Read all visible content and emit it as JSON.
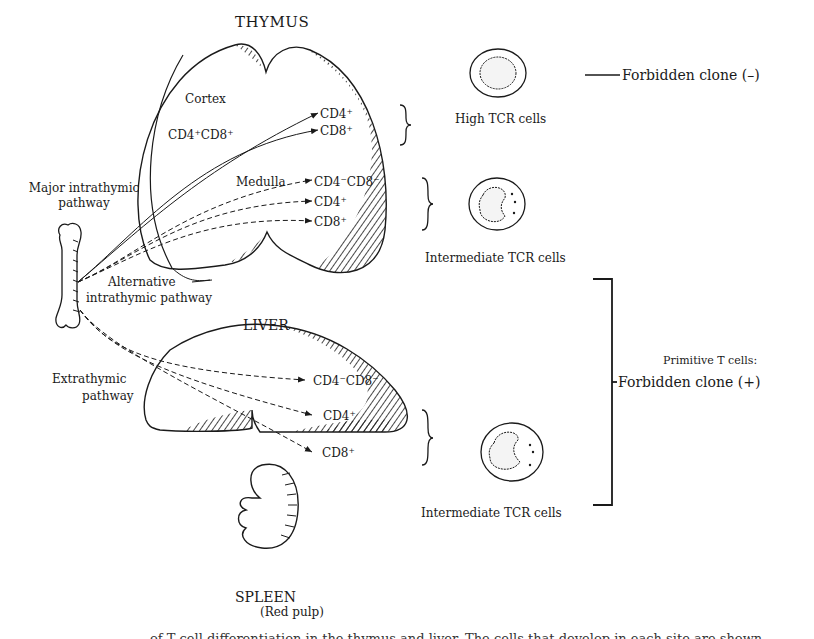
{
  "organs": {
    "thymus": {
      "title": "THYMUS",
      "cortex": "Cortex",
      "medulla": "Medulla",
      "precursor": "CD4⁺CD8⁺"
    },
    "liver": {
      "title": "LIVER"
    },
    "spleen": {
      "title": "SPLEEN",
      "subtitle": "(Red pulp)"
    }
  },
  "pathways": {
    "major": [
      "Major intrathymic",
      "pathway"
    ],
    "alternative": [
      "Alternative",
      "intrathymic pathway"
    ],
    "extrathymic": [
      "Extrathymic",
      "pathway"
    ]
  },
  "thymus_outputs": {
    "major": [
      "CD4⁺",
      "CD8⁺"
    ],
    "alternative": [
      "CD4⁻CD8⁻",
      "CD4⁺",
      "CD8⁺"
    ]
  },
  "liver_outputs": [
    "CD4⁻CD8⁻",
    "CD4⁺",
    "CD8⁺"
  ],
  "cell_groups": {
    "high": "High TCR cells",
    "intermediate_thymus": "Intermediate TCR cells",
    "intermediate_liver": "Intermediate TCR cells"
  },
  "outcomes": {
    "negative": "Forbidden clone (–)",
    "primitive_heading": "Primitive T cells:",
    "positive": "Forbidden clone (+)"
  },
  "caption_fragment": "of T cell differentiation in the thymus and liver. The cells that develop in each site are shown"
}
